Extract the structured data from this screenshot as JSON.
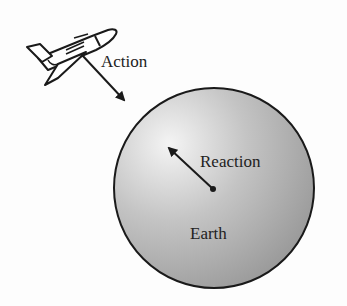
{
  "diagram": {
    "labels": {
      "action": "Action",
      "reaction": "Reaction",
      "earth": "Earth"
    },
    "objects": [
      {
        "name": "space-shuttle",
        "position": "upper-left"
      },
      {
        "name": "earth",
        "shape": "circle",
        "center": [
          214,
          188
        ],
        "radius": 100
      }
    ],
    "arrows": [
      {
        "name": "action-arrow",
        "from": [
          82,
          55
        ],
        "to": [
          126,
          102
        ],
        "label": "Action"
      },
      {
        "name": "reaction-arrow",
        "from": [
          213,
          189
        ],
        "to": [
          167,
          146
        ],
        "label": "Reaction"
      }
    ],
    "colors": {
      "earth_light": "#f2f2f2",
      "earth_dark": "#9a9a9a",
      "stroke": "#1a1a1a"
    }
  }
}
